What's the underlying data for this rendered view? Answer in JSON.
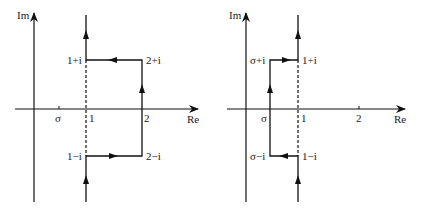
{
  "panels": [
    {
      "id": "left",
      "axis_labels": {
        "im": "Im",
        "re": "Re"
      },
      "ticks": {
        "sigma": "σ",
        "one": "1",
        "two": "2"
      },
      "vertices": {
        "top_left": "1+i",
        "top_right": "2+i",
        "bottom_left": "1−i",
        "bottom_right": "2−i"
      },
      "path_description": "Contour up the line Re=1 detours right around rectangle through 1−i, 2−i, 2+i, 1+i"
    },
    {
      "id": "right",
      "axis_labels": {
        "im": "Im",
        "re": "Re"
      },
      "ticks": {
        "sigma": "σ",
        "one": "1",
        "two": "2"
      },
      "vertices": {
        "top_left": "σ+i",
        "top_right": "1+i",
        "bottom_left": "σ−i",
        "bottom_right": "1−i"
      },
      "path_description": "Contour up the line Re=1 detours left around rectangle through 1−i, σ−i, σ+i, 1+i"
    }
  ],
  "colors": {
    "line": "#111111",
    "text": "#222222",
    "background": "#ffffff"
  }
}
